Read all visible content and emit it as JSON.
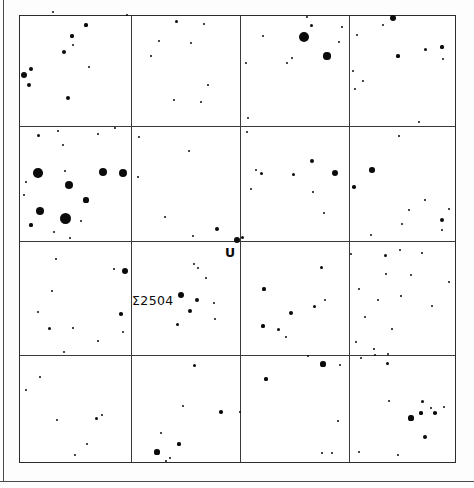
{
  "chart_data": {
    "type": "scatter",
    "title": "",
    "subtitle": "",
    "xlabel": "",
    "ylabel": "",
    "grid": true,
    "legend_position": "none",
    "axis_ranges": {
      "x": [
        0,
        4
      ],
      "y": [
        0,
        4
      ]
    },
    "grid_columns": 4,
    "grid_rows": 4,
    "frame": {
      "x": 19,
      "y": 15,
      "width": 437,
      "height": 448
    },
    "grid_x_positions": [
      130,
      239,
      348
    ],
    "grid_y_positions": [
      125,
      240,
      354
    ],
    "annotations": [
      {
        "name": "U",
        "text": "U",
        "x": 224,
        "y": 246,
        "target_star_x": 236,
        "target_star_y": 239
      },
      {
        "name": "sigma-2504",
        "text": "Σ2504",
        "x": 131,
        "y": 294,
        "target_star_x": 180,
        "target_star_y": 294
      }
    ],
    "magnitude_scale": {
      "brightest_radius_px": 5.5,
      "faintest_radius_px": 1.0
    },
    "points": [
      {
        "x": 23,
        "y": 74,
        "r": 3.0
      },
      {
        "x": 28,
        "y": 84,
        "r": 2.4
      },
      {
        "x": 30,
        "y": 68,
        "r": 2.2
      },
      {
        "x": 63,
        "y": 51,
        "r": 2.2
      },
      {
        "x": 67,
        "y": 97,
        "r": 2.0
      },
      {
        "x": 88,
        "y": 66,
        "r": 1.4
      },
      {
        "x": 71,
        "y": 35,
        "r": 1.6
      },
      {
        "x": 85,
        "y": 24,
        "r": 1.6
      },
      {
        "x": 72,
        "y": 44,
        "r": 1.2
      },
      {
        "x": 52,
        "y": 11,
        "r": 1.1
      },
      {
        "x": 126,
        "y": 14,
        "r": 1.0
      },
      {
        "x": 150,
        "y": 55,
        "r": 1.4
      },
      {
        "x": 158,
        "y": 40,
        "r": 1.2
      },
      {
        "x": 173,
        "y": 99,
        "r": 1.1
      },
      {
        "x": 175,
        "y": 20,
        "r": 1.5
      },
      {
        "x": 190,
        "y": 42,
        "r": 1.1
      },
      {
        "x": 203,
        "y": 23,
        "r": 1.2
      },
      {
        "x": 200,
        "y": 101,
        "r": 1.2
      },
      {
        "x": 207,
        "y": 84,
        "r": 1.2
      },
      {
        "x": 245,
        "y": 62,
        "r": 1.1
      },
      {
        "x": 247,
        "y": 117,
        "r": 1.0
      },
      {
        "x": 262,
        "y": 35,
        "r": 1.4
      },
      {
        "x": 286,
        "y": 62,
        "r": 1.2
      },
      {
        "x": 291,
        "y": 57,
        "r": 1.2
      },
      {
        "x": 303,
        "y": 36,
        "r": 5.2
      },
      {
        "x": 326,
        "y": 55,
        "r": 3.6
      },
      {
        "x": 310,
        "y": 24,
        "r": 1.5
      },
      {
        "x": 306,
        "y": 16,
        "r": 1.2
      },
      {
        "x": 338,
        "y": 41,
        "r": 1.4
      },
      {
        "x": 341,
        "y": 26,
        "r": 1.3
      },
      {
        "x": 392,
        "y": 17,
        "r": 3.0
      },
      {
        "x": 382,
        "y": 24,
        "r": 1.2
      },
      {
        "x": 356,
        "y": 34,
        "r": 1.2
      },
      {
        "x": 397,
        "y": 55,
        "r": 1.6
      },
      {
        "x": 424,
        "y": 48,
        "r": 1.5
      },
      {
        "x": 441,
        "y": 46,
        "r": 1.6
      },
      {
        "x": 442,
        "y": 58,
        "r": 1.4
      },
      {
        "x": 362,
        "y": 80,
        "r": 1.2
      },
      {
        "x": 354,
        "y": 88,
        "r": 1.2
      },
      {
        "x": 352,
        "y": 70,
        "r": 1.0
      },
      {
        "x": 418,
        "y": 121,
        "r": 1.1
      },
      {
        "x": 37,
        "y": 134,
        "r": 1.5
      },
      {
        "x": 57,
        "y": 130,
        "r": 1.2
      },
      {
        "x": 62,
        "y": 144,
        "r": 1.1
      },
      {
        "x": 97,
        "y": 133,
        "r": 1.1
      },
      {
        "x": 114,
        "y": 127,
        "r": 1.3
      },
      {
        "x": 37,
        "y": 172,
        "r": 4.8
      },
      {
        "x": 64,
        "y": 170,
        "r": 1.4
      },
      {
        "x": 68,
        "y": 184,
        "r": 4.4
      },
      {
        "x": 25,
        "y": 181,
        "r": 1.1
      },
      {
        "x": 23,
        "y": 194,
        "r": 1.0
      },
      {
        "x": 39,
        "y": 210,
        "r": 4.0
      },
      {
        "x": 30,
        "y": 224,
        "r": 1.6
      },
      {
        "x": 64,
        "y": 217,
        "r": 5.5
      },
      {
        "x": 85,
        "y": 199,
        "r": 2.6
      },
      {
        "x": 80,
        "y": 220,
        "r": 1.2
      },
      {
        "x": 69,
        "y": 237,
        "r": 1.2
      },
      {
        "x": 102,
        "y": 171,
        "r": 4.4
      },
      {
        "x": 122,
        "y": 172,
        "r": 3.9
      },
      {
        "x": 53,
        "y": 231,
        "r": 1.0
      },
      {
        "x": 138,
        "y": 136,
        "r": 1.3
      },
      {
        "x": 188,
        "y": 150,
        "r": 1.4
      },
      {
        "x": 137,
        "y": 176,
        "r": 1.2
      },
      {
        "x": 164,
        "y": 216,
        "r": 1.4
      },
      {
        "x": 192,
        "y": 235,
        "r": 1.3
      },
      {
        "x": 216,
        "y": 228,
        "r": 2.3
      },
      {
        "x": 236,
        "y": 239,
        "r": 3.1
      },
      {
        "x": 246,
        "y": 131,
        "r": 1.4
      },
      {
        "x": 260,
        "y": 172,
        "r": 1.5
      },
      {
        "x": 255,
        "y": 169,
        "r": 1.2
      },
      {
        "x": 250,
        "y": 188,
        "r": 1.2
      },
      {
        "x": 292,
        "y": 173,
        "r": 1.5
      },
      {
        "x": 311,
        "y": 160,
        "r": 1.9
      },
      {
        "x": 334,
        "y": 172,
        "r": 3.4
      },
      {
        "x": 312,
        "y": 191,
        "r": 1.4
      },
      {
        "x": 323,
        "y": 212,
        "r": 1.4
      },
      {
        "x": 241,
        "y": 236,
        "r": 1.5
      },
      {
        "x": 353,
        "y": 186,
        "r": 1.7
      },
      {
        "x": 371,
        "y": 169,
        "r": 2.8
      },
      {
        "x": 398,
        "y": 135,
        "r": 1.4
      },
      {
        "x": 408,
        "y": 209,
        "r": 1.4
      },
      {
        "x": 424,
        "y": 199,
        "r": 1.4
      },
      {
        "x": 441,
        "y": 219,
        "r": 2.1
      },
      {
        "x": 448,
        "y": 208,
        "r": 1.2
      },
      {
        "x": 441,
        "y": 229,
        "r": 1.2
      },
      {
        "x": 401,
        "y": 223,
        "r": 1.1
      },
      {
        "x": 370,
        "y": 234,
        "r": 1.2
      },
      {
        "x": 55,
        "y": 258,
        "r": 1.4
      },
      {
        "x": 51,
        "y": 290,
        "r": 1.3
      },
      {
        "x": 37,
        "y": 311,
        "r": 1.3
      },
      {
        "x": 48,
        "y": 327,
        "r": 1.5
      },
      {
        "x": 72,
        "y": 327,
        "r": 1.3
      },
      {
        "x": 97,
        "y": 340,
        "r": 1.4
      },
      {
        "x": 120,
        "y": 313,
        "r": 1.8
      },
      {
        "x": 124,
        "y": 270,
        "r": 3.0
      },
      {
        "x": 113,
        "y": 268,
        "r": 1.2
      },
      {
        "x": 122,
        "y": 331,
        "r": 1.1
      },
      {
        "x": 193,
        "y": 263,
        "r": 1.3
      },
      {
        "x": 205,
        "y": 277,
        "r": 1.2
      },
      {
        "x": 180,
        "y": 294,
        "r": 3.3
      },
      {
        "x": 196,
        "y": 299,
        "r": 2.1
      },
      {
        "x": 189,
        "y": 310,
        "r": 1.9
      },
      {
        "x": 176,
        "y": 323,
        "r": 1.5
      },
      {
        "x": 213,
        "y": 302,
        "r": 1.3
      },
      {
        "x": 214,
        "y": 318,
        "r": 1.3
      },
      {
        "x": 197,
        "y": 267,
        "r": 1.1
      },
      {
        "x": 263,
        "y": 288,
        "r": 1.6
      },
      {
        "x": 290,
        "y": 312,
        "r": 2.2
      },
      {
        "x": 313,
        "y": 305,
        "r": 1.5
      },
      {
        "x": 262,
        "y": 325,
        "r": 1.6
      },
      {
        "x": 277,
        "y": 328,
        "r": 1.5
      },
      {
        "x": 285,
        "y": 336,
        "r": 1.4
      },
      {
        "x": 320,
        "y": 266,
        "r": 1.5
      },
      {
        "x": 324,
        "y": 299,
        "r": 1.2
      },
      {
        "x": 350,
        "y": 253,
        "r": 1.2
      },
      {
        "x": 384,
        "y": 254,
        "r": 1.5
      },
      {
        "x": 399,
        "y": 249,
        "r": 1.4
      },
      {
        "x": 421,
        "y": 252,
        "r": 1.2
      },
      {
        "x": 385,
        "y": 273,
        "r": 1.2
      },
      {
        "x": 410,
        "y": 274,
        "r": 1.1
      },
      {
        "x": 448,
        "y": 281,
        "r": 1.1
      },
      {
        "x": 358,
        "y": 288,
        "r": 1.3
      },
      {
        "x": 377,
        "y": 299,
        "r": 1.2
      },
      {
        "x": 400,
        "y": 295,
        "r": 1.2
      },
      {
        "x": 431,
        "y": 305,
        "r": 1.1
      },
      {
        "x": 364,
        "y": 316,
        "r": 1.3
      },
      {
        "x": 391,
        "y": 328,
        "r": 1.2
      },
      {
        "x": 355,
        "y": 341,
        "r": 1.2
      },
      {
        "x": 373,
        "y": 348,
        "r": 1.2
      },
      {
        "x": 39,
        "y": 376,
        "r": 1.3
      },
      {
        "x": 25,
        "y": 389,
        "r": 1.4
      },
      {
        "x": 56,
        "y": 419,
        "r": 1.4
      },
      {
        "x": 95,
        "y": 417,
        "r": 1.5
      },
      {
        "x": 101,
        "y": 414,
        "r": 1.4
      },
      {
        "x": 86,
        "y": 443,
        "r": 1.4
      },
      {
        "x": 74,
        "y": 454,
        "r": 1.3
      },
      {
        "x": 63,
        "y": 351,
        "r": 1.3
      },
      {
        "x": 193,
        "y": 364,
        "r": 1.5
      },
      {
        "x": 182,
        "y": 405,
        "r": 1.4
      },
      {
        "x": 220,
        "y": 411,
        "r": 1.8
      },
      {
        "x": 160,
        "y": 432,
        "r": 1.3
      },
      {
        "x": 178,
        "y": 443,
        "r": 1.6
      },
      {
        "x": 156,
        "y": 451,
        "r": 2.6
      },
      {
        "x": 169,
        "y": 457,
        "r": 1.2
      },
      {
        "x": 165,
        "y": 460,
        "r": 1.1
      },
      {
        "x": 239,
        "y": 411,
        "r": 1.0
      },
      {
        "x": 265,
        "y": 378,
        "r": 1.6
      },
      {
        "x": 322,
        "y": 363,
        "r": 2.6
      },
      {
        "x": 307,
        "y": 355,
        "r": 1.0
      },
      {
        "x": 339,
        "y": 364,
        "r": 1.4
      },
      {
        "x": 337,
        "y": 420,
        "r": 1.3
      },
      {
        "x": 321,
        "y": 452,
        "r": 1.3
      },
      {
        "x": 331,
        "y": 452,
        "r": 1.3
      },
      {
        "x": 360,
        "y": 357,
        "r": 1.4
      },
      {
        "x": 374,
        "y": 354,
        "r": 1.1
      },
      {
        "x": 386,
        "y": 362,
        "r": 1.5
      },
      {
        "x": 387,
        "y": 353,
        "r": 1.2
      },
      {
        "x": 388,
        "y": 400,
        "r": 1.4
      },
      {
        "x": 421,
        "y": 400,
        "r": 1.5
      },
      {
        "x": 430,
        "y": 407,
        "r": 1.3
      },
      {
        "x": 420,
        "y": 412,
        "r": 1.6
      },
      {
        "x": 434,
        "y": 412,
        "r": 1.8
      },
      {
        "x": 443,
        "y": 406,
        "r": 1.4
      },
      {
        "x": 410,
        "y": 417,
        "r": 2.6
      },
      {
        "x": 424,
        "y": 436,
        "r": 2.3
      },
      {
        "x": 358,
        "y": 451,
        "r": 1.3
      },
      {
        "x": 397,
        "y": 454,
        "r": 1.3
      }
    ]
  }
}
